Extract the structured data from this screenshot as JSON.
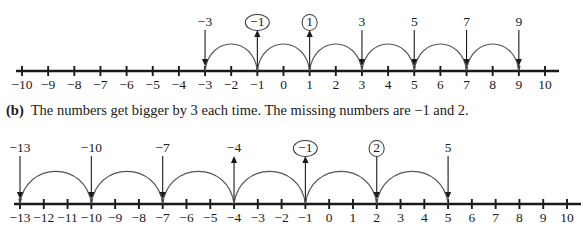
{
  "page": {
    "background": "#ffffff",
    "ink": "#1a1a1a",
    "arc_color": "#555555"
  },
  "answer_b": {
    "tag": "(b)",
    "text": "The numbers get bigger by 3 each time. The missing numbers are −1 and 2."
  },
  "number_lines": [
    {
      "id": "number-line-top",
      "axis": {
        "min": -10,
        "max": 10,
        "step": 1,
        "x_start": 22,
        "x_end": 545,
        "baseline_y": 71,
        "tick_half_height": 5,
        "label_y": 78
      },
      "tick_labels": [
        "−10",
        "−9",
        "−8",
        "−7",
        "−6",
        "−5",
        "−4",
        "−3",
        "−2",
        "−1",
        "0",
        "1",
        "2",
        "3",
        "4",
        "5",
        "6",
        "7",
        "8",
        "9",
        "10"
      ],
      "hop_step": 2,
      "markers": [
        {
          "value": -3,
          "label": "−3",
          "circled": false,
          "arrow": "down"
        },
        {
          "value": -1,
          "label": "−1",
          "circled": true,
          "arrow": "up"
        },
        {
          "value": 1,
          "label": "1",
          "circled": true,
          "arrow": "up"
        },
        {
          "value": 3,
          "label": "3",
          "circled": false,
          "arrow": "down"
        },
        {
          "value": 5,
          "label": "5",
          "circled": false,
          "arrow": "down"
        },
        {
          "value": 7,
          "label": "7",
          "circled": false,
          "arrow": "down"
        },
        {
          "value": 9,
          "label": "9",
          "circled": false,
          "arrow": "down"
        }
      ],
      "arcs": [
        {
          "from": -3,
          "to": -1
        },
        {
          "from": -1,
          "to": 1
        },
        {
          "from": 1,
          "to": 3
        },
        {
          "from": 3,
          "to": 5
        },
        {
          "from": 5,
          "to": 7
        },
        {
          "from": 7,
          "to": 9
        }
      ],
      "endpoint_dot": {
        "value": 9
      },
      "label_y": 14,
      "arrow_top_y": 30,
      "arrow_bottom_y": 66
    },
    {
      "id": "number-line-bottom",
      "axis": {
        "min": -13,
        "max": 10,
        "step": 1,
        "x_start": 20,
        "x_end": 567,
        "baseline_y": 204,
        "tick_half_height": 5,
        "label_y": 211,
        "y_offset": 0
      },
      "tick_labels": [
        "−13",
        "−12",
        "−11",
        "−10",
        "−9",
        "−8",
        "−7",
        "−6",
        "−5",
        "−4",
        "−3",
        "−2",
        "−1",
        "0",
        "1",
        "2",
        "3",
        "4",
        "5",
        "6",
        "7",
        "8",
        "9",
        "10"
      ],
      "hop_step": 3,
      "markers": [
        {
          "value": -13,
          "label": "−13",
          "circled": false,
          "arrow": "down"
        },
        {
          "value": -10,
          "label": "−10",
          "circled": false,
          "arrow": "down"
        },
        {
          "value": -7,
          "label": "−7",
          "circled": false,
          "arrow": "down"
        },
        {
          "value": -4,
          "label": "−4",
          "circled": false,
          "arrow": "up"
        },
        {
          "value": -1,
          "label": "−1",
          "circled": true,
          "arrow": "up"
        },
        {
          "value": 2,
          "label": "2",
          "circled": true,
          "arrow": "down"
        },
        {
          "value": 5,
          "label": "5",
          "circled": false,
          "arrow": "down"
        }
      ],
      "arcs": [
        {
          "from": -13,
          "to": -10
        },
        {
          "from": -10,
          "to": -7
        },
        {
          "from": -7,
          "to": -4
        },
        {
          "from": -4,
          "to": -1
        },
        {
          "from": -1,
          "to": 2
        },
        {
          "from": 2,
          "to": 5
        }
      ],
      "endpoint_dot": {
        "value": -13
      },
      "label_y": 140,
      "arrow_top_y": 156,
      "arrow_bottom_y": 199
    }
  ],
  "prose_position": {
    "x": 6,
    "y": 101
  }
}
